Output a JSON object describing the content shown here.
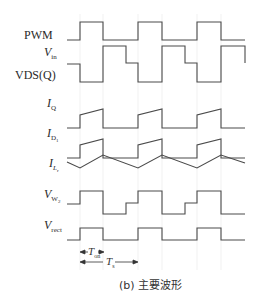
{
  "figure": {
    "caption": "(b) 主要波形",
    "line_color": "#444444",
    "grid_color": "#e6e6e6",
    "signals": [
      {
        "id": "pwm",
        "name": "PWM",
        "sub": "",
        "subsub": ""
      },
      {
        "id": "vin",
        "name": "V",
        "sub": "in",
        "subsub": ""
      },
      {
        "id": "vds",
        "name": "VDS(Q)",
        "sub": "",
        "subsub": ""
      },
      {
        "id": "iq",
        "name": "I",
        "sub": "Q",
        "subsub": ""
      },
      {
        "id": "id1",
        "name": "I",
        "sub": "D",
        "subsub": "1"
      },
      {
        "id": "ilr",
        "name": "I",
        "sub": "L",
        "subsub": "r"
      },
      {
        "id": "vw2",
        "name": "V",
        "sub": "W",
        "subsub": "2"
      },
      {
        "id": "vrect",
        "name": "V",
        "sub": "rect",
        "subsub": ""
      }
    ],
    "timing": {
      "t_on": {
        "name": "T",
        "sub": "on"
      },
      "t_s": {
        "name": "T",
        "sub": "s"
      }
    },
    "periods": 3
  }
}
